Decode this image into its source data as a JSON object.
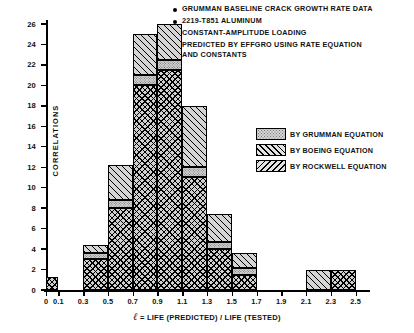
{
  "notes": [
    "GRUMMAN BASELINE CRACK GROWTH RATE DATA",
    "2219-T851 ALUMINUM",
    "CONSTANT-AMPLITUDE LOADING",
    "PREDICTED BY EFFGRO USING RATE EQUATION\nAND CONSTANTS"
  ],
  "legend": [
    {
      "label": "BY GRUMMAN EQUATION",
      "pattern": "stipple",
      "color": "#d4d4d4"
    },
    {
      "label": "BY BOEING EQUATION",
      "pattern": "forward-hatch",
      "color": "#e2e2e2"
    },
    {
      "label": "BY ROCKWELL EQUATION",
      "pattern": "backward-hatch",
      "color": "#e2e2e2"
    }
  ],
  "chart_data": {
    "type": "bar",
    "title": "",
    "xlabel_prefix": "ℓ",
    "xlabel": "= LIFE (PREDICTED) / LIFE (TESTED)",
    "ylabel": "CORRELATIONS",
    "stacked": true,
    "grid": false,
    "legend_position": "right",
    "xlim": [
      0,
      2.6
    ],
    "ylim": [
      0,
      26
    ],
    "ytick_labels": [
      "0",
      "2",
      "4",
      "6",
      "8",
      "10",
      "12",
      "14",
      "16",
      "18",
      "20",
      "22",
      "24",
      "26"
    ],
    "yticks": [
      0,
      2,
      4,
      6,
      8,
      10,
      12,
      14,
      16,
      18,
      20,
      22,
      24,
      26
    ],
    "xtick_labels": [
      "0",
      "0.1",
      "0.3",
      "0.5",
      "0.7",
      "0.9",
      "1.1",
      "1.3",
      "1.5",
      "1.7",
      "1.9",
      "2.1",
      "2.3",
      "2.5"
    ],
    "xticks": [
      0,
      0.1,
      0.3,
      0.5,
      0.7,
      0.9,
      1.1,
      1.3,
      1.5,
      1.7,
      1.9,
      2.1,
      2.3,
      2.5
    ],
    "categories": [
      "0-0.1",
      "0.1-0.3",
      "0.3-0.5",
      "0.5-0.7",
      "0.7-0.9",
      "0.9-1.1",
      "1.1-1.3",
      "1.3-1.5",
      "1.5-1.7",
      "1.7-1.9",
      "1.9-2.1",
      "2.1-2.3",
      "2.3-2.5"
    ],
    "bin_edges": [
      0,
      0.1,
      0.3,
      0.5,
      0.7,
      0.9,
      1.1,
      1.3,
      1.5,
      1.7,
      1.9,
      2.1,
      2.3,
      2.5
    ],
    "series": [
      {
        "name": "BY ROCKWELL EQUATION",
        "values": [
          1.3,
          0,
          3,
          8,
          20,
          21.5,
          11,
          4,
          1.5,
          0,
          0,
          0,
          2
        ]
      },
      {
        "name": "BY GRUMMAN EQUATION",
        "values": [
          0,
          0,
          0.6,
          0.8,
          1,
          1,
          1,
          0.7,
          0.7,
          0,
          0,
          0,
          0
        ]
      },
      {
        "name": "BY BOEING EQUATION",
        "values": [
          0,
          0,
          0.8,
          3.4,
          4,
          3.5,
          6,
          2.7,
          1.4,
          0,
          0,
          2,
          0
        ]
      }
    ],
    "totals": [
      1.3,
      0,
      4.4,
      12.2,
      25,
      26,
      18,
      7.4,
      3.6,
      0,
      0,
      2,
      2
    ]
  }
}
